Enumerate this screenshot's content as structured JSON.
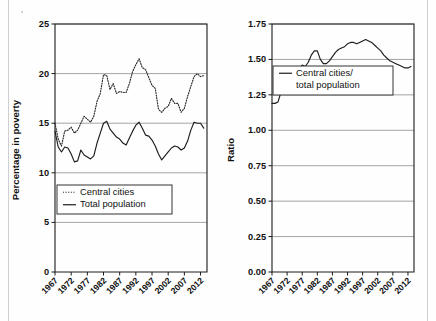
{
  "figure": {
    "background_color": "#fefefe",
    "axis_color": "#1a1a1a",
    "grid_color": "#9a9a9a",
    "series_color": "#1c1c1c"
  },
  "chart_data": [
    {
      "id": "poverty-percentage",
      "type": "line",
      "title": "",
      "xlabel": "",
      "ylabel": "Percentage in poverty",
      "xlim": [
        1967,
        2014
      ],
      "ylim": [
        0,
        25
      ],
      "ytick_labels": [
        "0",
        "5",
        "10",
        "15",
        "20",
        "25"
      ],
      "ytick_values": [
        0,
        5,
        10,
        15,
        20,
        25
      ],
      "xtick_labels": [
        "1967",
        "1972",
        "1977",
        "1982",
        "1987",
        "1992",
        "1997",
        "2002",
        "2007",
        "2012"
      ],
      "xtick_values": [
        1967,
        1972,
        1977,
        1982,
        1987,
        1992,
        1997,
        2002,
        2007,
        2012
      ],
      "grid": "horizontal",
      "legend_position": "lower-center",
      "series": [
        {
          "name": "Central cities",
          "style": "dotted",
          "x": [
            1967,
            1968,
            1969,
            1970,
            1971,
            1972,
            1973,
            1974,
            1975,
            1976,
            1977,
            1978,
            1979,
            1980,
            1981,
            1982,
            1983,
            1984,
            1985,
            1986,
            1987,
            1988,
            1989,
            1990,
            1991,
            1992,
            1993,
            1994,
            1995,
            1996,
            1997,
            1998,
            1999,
            2000,
            2001,
            2002,
            2003,
            2004,
            2005,
            2006,
            2007,
            2008,
            2009,
            2010,
            2011,
            2012,
            2013
          ],
          "values": [
            15.0,
            13.4,
            12.7,
            14.2,
            14.3,
            14.6,
            14.0,
            14.3,
            15.0,
            15.7,
            15.4,
            15.1,
            15.7,
            17.2,
            18.0,
            19.9,
            19.8,
            18.4,
            19.0,
            18.0,
            18.2,
            18.1,
            18.1,
            19.0,
            20.2,
            20.9,
            21.5,
            20.6,
            20.4,
            19.6,
            18.8,
            18.5,
            16.4,
            16.1,
            16.5,
            16.7,
            17.5,
            17.0,
            17.0,
            16.1,
            16.5,
            17.7,
            18.7,
            19.7,
            20.0,
            19.7,
            19.8
          ],
          "legend_label": "Central cities"
        },
        {
          "name": "Total population",
          "style": "solid",
          "x": [
            1967,
            1968,
            1969,
            1970,
            1971,
            1972,
            1973,
            1974,
            1975,
            1976,
            1977,
            1978,
            1979,
            1980,
            1981,
            1982,
            1983,
            1984,
            1985,
            1986,
            1987,
            1988,
            1989,
            1990,
            1991,
            1992,
            1993,
            1994,
            1995,
            1996,
            1997,
            1998,
            1999,
            2000,
            2001,
            2002,
            2003,
            2004,
            2005,
            2006,
            2007,
            2008,
            2009,
            2010,
            2011,
            2012,
            2013
          ],
          "values": [
            14.2,
            12.6,
            12.1,
            12.6,
            12.5,
            11.9,
            11.1,
            11.2,
            12.3,
            11.8,
            11.6,
            11.4,
            11.7,
            13.0,
            14.0,
            15.0,
            15.2,
            14.4,
            14.0,
            13.6,
            13.4,
            13.0,
            12.8,
            13.5,
            14.2,
            14.8,
            15.1,
            14.5,
            13.8,
            13.7,
            13.3,
            12.7,
            11.9,
            11.3,
            11.7,
            12.1,
            12.5,
            12.7,
            12.6,
            12.3,
            12.5,
            13.2,
            14.3,
            15.1,
            15.0,
            15.0,
            14.5
          ],
          "legend_label": "Total population"
        }
      ],
      "legend": [
        {
          "label": "Central cities",
          "style": "dotted"
        },
        {
          "label": "Total population",
          "style": "solid"
        }
      ]
    },
    {
      "id": "poverty-ratio",
      "type": "line",
      "title": "",
      "xlabel": "",
      "ylabel": "Ratio",
      "xlim": [
        1967,
        2014
      ],
      "ylim": [
        0.0,
        1.75
      ],
      "ytick_labels": [
        "0.00",
        "0.25",
        "0.50",
        "0.75",
        "1.00",
        "1.25",
        "1.50",
        "1.75"
      ],
      "ytick_values": [
        0.0,
        0.25,
        0.5,
        0.75,
        1.0,
        1.25,
        1.5,
        1.75
      ],
      "xtick_labels": [
        "1967",
        "1972",
        "1977",
        "1982",
        "1987",
        "1992",
        "1997",
        "2002",
        "2007",
        "2012"
      ],
      "xtick_values": [
        1967,
        1972,
        1977,
        1982,
        1987,
        1992,
        1997,
        2002,
        2007,
        2012
      ],
      "grid": "horizontal",
      "legend_position": "upper-center",
      "series": [
        {
          "name": "Central cities/total population",
          "style": "solid",
          "x": [
            1967,
            1968,
            1969,
            1970,
            1971,
            1972,
            1973,
            1974,
            1975,
            1976,
            1977,
            1978,
            1979,
            1980,
            1981,
            1982,
            1983,
            1984,
            1985,
            1986,
            1987,
            1988,
            1989,
            1990,
            1991,
            1992,
            1993,
            1994,
            1995,
            1996,
            1997,
            1998,
            1999,
            2000,
            2001,
            2002,
            2003,
            2004,
            2005,
            2006,
            2007,
            2008,
            2009,
            2010,
            2011,
            2012,
            2013
          ],
          "values": [
            1.19,
            1.19,
            1.2,
            1.27,
            1.32,
            1.36,
            1.38,
            1.4,
            1.4,
            1.44,
            1.46,
            1.45,
            1.48,
            1.53,
            1.56,
            1.56,
            1.5,
            1.47,
            1.47,
            1.49,
            1.52,
            1.55,
            1.57,
            1.58,
            1.59,
            1.61,
            1.62,
            1.62,
            1.61,
            1.62,
            1.63,
            1.64,
            1.63,
            1.62,
            1.6,
            1.58,
            1.56,
            1.53,
            1.51,
            1.49,
            1.48,
            1.47,
            1.46,
            1.45,
            1.44,
            1.44,
            1.45
          ],
          "legend_label": "Central cities/ total population"
        }
      ],
      "legend": [
        {
          "label_line1": "Central cities/",
          "label_line2": "total population",
          "style": "solid"
        }
      ]
    }
  ]
}
